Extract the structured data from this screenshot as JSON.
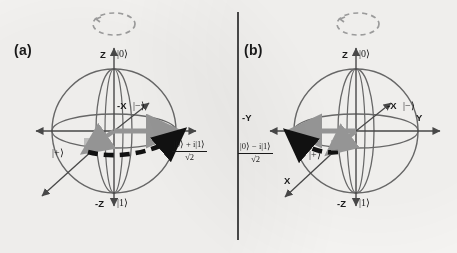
{
  "figure": {
    "type": "bloch-sphere-pair",
    "background_color": "#f7f6f4",
    "line_color": "#5a5a5a",
    "accent_dark": "#111111",
    "accent_grey": "#9a9a9a",
    "divider": "vertical-rule"
  },
  "panels": [
    {
      "id": "a",
      "label": "(a)",
      "precession": "dashed-ellipse-ccw",
      "axes": [
        {
          "name": "z-axis-positive",
          "label": "Z",
          "ket": "|0⟩"
        },
        {
          "name": "z-axis-negative",
          "label": "-Z",
          "ket": "|1⟩"
        },
        {
          "name": "x-axis-negative",
          "label": "-X",
          "ket": "|−⟩"
        },
        {
          "name": "x-axis-positive",
          "label": "",
          "ket": "|+⟩"
        }
      ],
      "state_vector": {
        "name": "state-vector-arrow",
        "color": "#111111",
        "direction": "right",
        "numerator": "|0⟩ + i|1⟩",
        "denominator": "√2"
      },
      "grey_vector": {
        "name": "grey-reference-arrow",
        "color": "#9a9a9a",
        "direction": "right"
      }
    },
    {
      "id": "b",
      "label": "(b)",
      "precession": "dashed-ellipse-ccw",
      "axes": [
        {
          "name": "z-axis-positive",
          "label": "Z",
          "ket": "|0⟩"
        },
        {
          "name": "z-axis-negative",
          "label": "-Z",
          "ket": "|1⟩"
        },
        {
          "name": "x-axis-negative",
          "label": "-X",
          "ket": "|−⟩"
        },
        {
          "name": "x-axis-positive",
          "label": "X",
          "ket": "|+⟩"
        },
        {
          "name": "y-axis-positive",
          "label": "Y",
          "ket": ""
        },
        {
          "name": "y-axis-negative",
          "label": "-Y",
          "ket": ""
        }
      ],
      "state_vector": {
        "name": "state-vector-arrow",
        "color": "#111111",
        "direction": "left",
        "numerator": "|0⟩ − i|1⟩",
        "denominator": "√2"
      },
      "grey_vector": {
        "name": "grey-reference-arrow",
        "color": "#9a9a9a",
        "direction": "left"
      }
    }
  ]
}
